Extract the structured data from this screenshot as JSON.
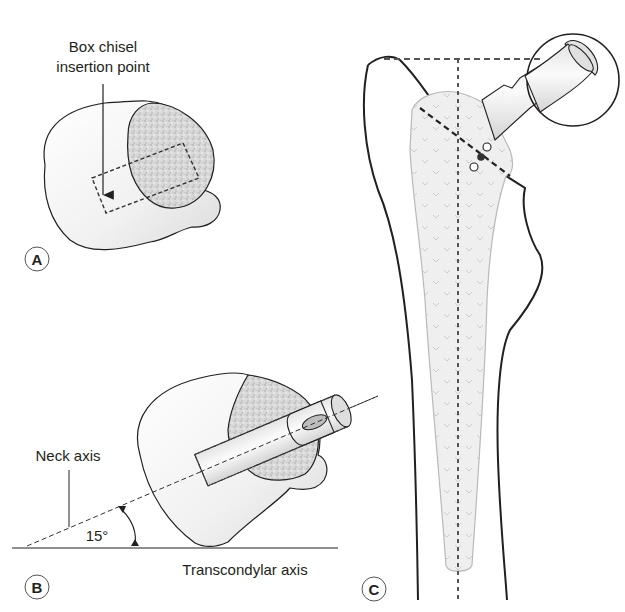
{
  "figure": {
    "panels": [
      {
        "id": "A",
        "label": "A",
        "annotations": [
          {
            "text_line1": "Box chisel",
            "text_line2": "insertion point"
          }
        ]
      },
      {
        "id": "B",
        "label": "B",
        "annotations": [
          {
            "text": "Neck axis"
          },
          {
            "text": "15°"
          },
          {
            "text": "Transcondylar axis"
          }
        ]
      },
      {
        "id": "C",
        "label": "C"
      }
    ],
    "colors": {
      "outline": "#231f20",
      "bone_fill": "#f3f3f3",
      "cancellous": "#cfcfcf",
      "implant_fill": "#ececec",
      "background": "#ffffff"
    }
  }
}
